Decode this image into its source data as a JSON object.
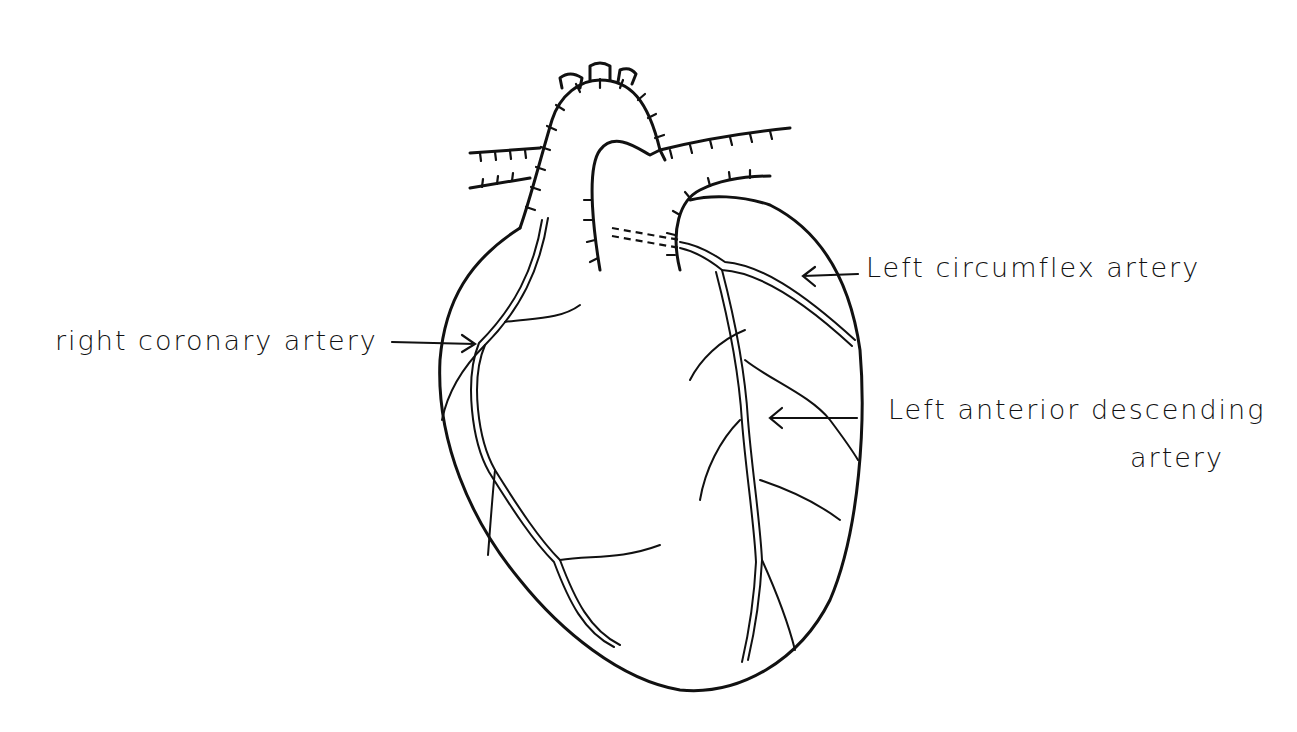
{
  "diagram": {
    "labels": {
      "right_coronary": "right coronary artery",
      "left_circumflex": "Left circumflex artery",
      "lad_line1": "Left anterior descending",
      "lad_line2": "artery"
    },
    "colors": {
      "ink": "#111111",
      "background": "#ffffff"
    }
  }
}
